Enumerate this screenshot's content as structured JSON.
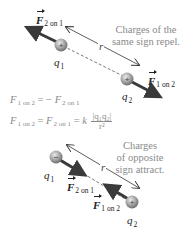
{
  "figure": {
    "top_panel": {
      "caption": "Charges of the same sign repel.",
      "caption_lines": [
        "Charges of the",
        "same sign repel."
      ],
      "charge_1": {
        "label": "q",
        "subscript": "1",
        "sign": "+"
      },
      "charge_2": {
        "label": "q",
        "subscript": "2",
        "sign": "+"
      },
      "force_on_1": {
        "symbol": "F",
        "subscript": "2 on 1"
      },
      "force_on_2": {
        "symbol": "F",
        "subscript": "1 on 2"
      },
      "distance_label": "r"
    },
    "equations": {
      "vector_eq": {
        "lhs": "F",
        "lhs_sub": "1 on 2",
        "op": "= −",
        "rhs": "F",
        "rhs_sub": "2 on 1"
      },
      "magnitude_eq": {
        "lhs": "F",
        "lhs_sub": "1 on 2",
        "mid": "F",
        "mid_sub": "2 on 1",
        "k": "k",
        "numerator": "|q₁q₂|",
        "denominator": "r²"
      }
    },
    "bottom_panel": {
      "caption": "Charges of opposite sign attract.",
      "caption_lines": [
        "Charges",
        "of opposite",
        "sign attract."
      ],
      "charge_1": {
        "label": "q",
        "subscript": "1",
        "sign": "−"
      },
      "charge_2": {
        "label": "q",
        "subscript": "2",
        "sign": "+"
      },
      "force_on_1": {
        "symbol": "F",
        "subscript": "2 on 1"
      },
      "force_on_2": {
        "symbol": "F",
        "subscript": "1 on 2"
      },
      "distance_label": "r"
    },
    "colors": {
      "caption_text": "#8a8a8a",
      "force_arrow": "#3a3a3a",
      "charge_sphere": "#9c9c9c",
      "dashed_line": "#555555",
      "label_text": "#222222"
    }
  }
}
